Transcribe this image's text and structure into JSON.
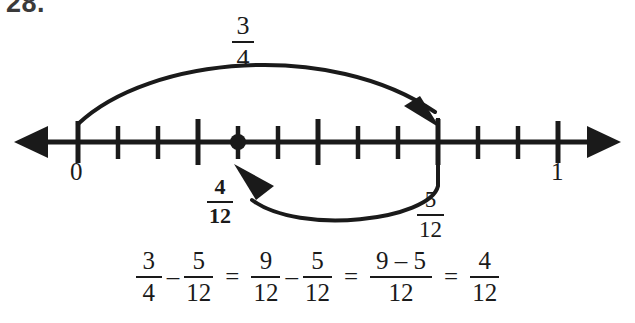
{
  "problem": {
    "number": "28."
  },
  "number_line": {
    "start_label": "0",
    "end_label": "1",
    "divisions": 12,
    "marked_point_label_numerator": "4",
    "marked_point_label_denominator": "12",
    "left_arrow_icon": "left-arrow-icon",
    "right_arrow_icon": "right-arrow-icon",
    "point_marker_icon": "point-dot-icon"
  },
  "arcs": {
    "top": {
      "label_numerator": "3",
      "label_denominator": "4",
      "from_value": "0",
      "to_value": "3/4",
      "direction": "right",
      "arrowhead_icon": "arc-arrowhead-right-icon"
    },
    "bottom": {
      "label_numerator": "5",
      "label_denominator": "12",
      "from_value": "3/4",
      "to_value": "4/12",
      "direction": "left",
      "arrowhead_icon": "arc-arrowhead-left-icon"
    }
  },
  "equation": {
    "t1_num": "3",
    "t1_den": "4",
    "op1": "–",
    "t2_num": "5",
    "t2_den": "12",
    "eq1": "=",
    "t3_num": "9",
    "t3_den": "12",
    "op2": "–",
    "t4_num": "5",
    "t4_den": "12",
    "eq2": "=",
    "t5_num": "9 – 5",
    "t5_den": "12",
    "eq3": "=",
    "t6_num": "4",
    "t6_den": "12"
  },
  "colors": {
    "ink": "#1a1a1a",
    "background": "#ffffff",
    "number_gray": "#3a3a3a"
  }
}
